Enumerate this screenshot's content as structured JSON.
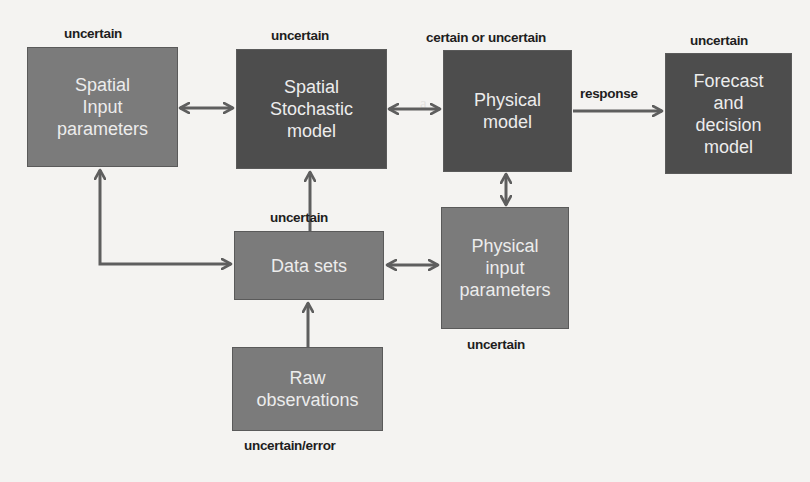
{
  "diagram": {
    "nodes": {
      "spatial_input": {
        "label": "Spatial\nInput\nparameters",
        "tag": "uncertain"
      },
      "spatial_stochastic": {
        "label": "Spatial\nStochastic\nmodel",
        "tag": "uncertain"
      },
      "physical_model": {
        "label": "Physical\nmodel",
        "tag": "certain or uncertain"
      },
      "forecast": {
        "label": "Forecast\nand\ndecision\nmodel",
        "tag": "uncertain"
      },
      "data_sets": {
        "label": "Data sets",
        "tag": "uncertain"
      },
      "physical_input": {
        "label": "Physical\ninput\nparameters",
        "tag": "uncertain"
      },
      "raw_observations": {
        "label": "Raw\nobservations",
        "tag": "uncertain/error"
      }
    },
    "edges": [
      {
        "from": "spatial_input",
        "to": "spatial_stochastic",
        "type": "bidirectional"
      },
      {
        "from": "spatial_stochastic",
        "to": "physical_model",
        "type": "bidirectional"
      },
      {
        "from": "physical_model",
        "to": "forecast",
        "type": "directed",
        "label": "response"
      },
      {
        "from": "physical_model",
        "to": "physical_input",
        "type": "bidirectional"
      },
      {
        "from": "data_sets",
        "to": "spatial_stochastic",
        "type": "directed"
      },
      {
        "from": "data_sets",
        "to": "spatial_input",
        "type": "bidirectional"
      },
      {
        "from": "data_sets",
        "to": "physical_input",
        "type": "bidirectional"
      },
      {
        "from": "raw_observations",
        "to": "data_sets",
        "type": "directed"
      }
    ],
    "edge_labels": {
      "response": "response"
    },
    "colors": {
      "box_mid": "#7b7b7b",
      "box_dark": "#4d4d4d",
      "arrow": "#5e5e5e",
      "text_light": "#ececec",
      "tag_text": "#1e1e1e"
    }
  }
}
